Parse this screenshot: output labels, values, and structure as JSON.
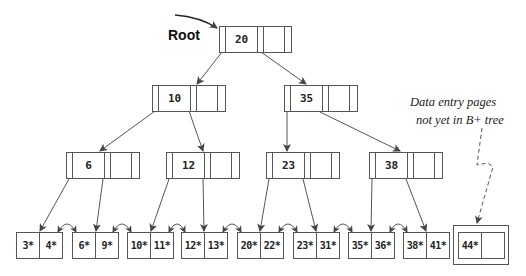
{
  "diagram": {
    "root_label": "Root",
    "note_lines": [
      "Data entry pages",
      "not yet in B+ tree"
    ],
    "line_color": "#555555",
    "levels": {
      "root": [
        {
          "id": "n20",
          "key": "20"
        }
      ],
      "level1": [
        {
          "id": "n10",
          "key": "10"
        },
        {
          "id": "n35",
          "key": "35"
        }
      ],
      "level2": [
        {
          "id": "n6",
          "key": "6"
        },
        {
          "id": "n12",
          "key": "12"
        },
        {
          "id": "n23",
          "key": "23"
        },
        {
          "id": "n38",
          "key": "38"
        }
      ]
    },
    "leaves": [
      {
        "entries": [
          "3*",
          "4*"
        ]
      },
      {
        "entries": [
          "6*",
          "9*"
        ]
      },
      {
        "entries": [
          "10*",
          "11*"
        ]
      },
      {
        "entries": [
          "12*",
          "13*"
        ]
      },
      {
        "entries": [
          "20*",
          "22*"
        ]
      },
      {
        "entries": [
          "23*",
          "31*"
        ]
      },
      {
        "entries": [
          "35*",
          "36*"
        ]
      },
      {
        "entries": [
          "38*",
          "41*"
        ]
      }
    ],
    "pending_leaf": {
      "entries": [
        "44*",
        ""
      ]
    },
    "edges": [
      [
        "n20",
        "n10"
      ],
      [
        "n20",
        "n35"
      ],
      [
        "n10",
        "n6"
      ],
      [
        "n10",
        "n12"
      ],
      [
        "n35",
        "n23"
      ],
      [
        "n35",
        "n38"
      ],
      [
        "n6",
        "leaf0"
      ],
      [
        "n6",
        "leaf1"
      ],
      [
        "n12",
        "leaf2"
      ],
      [
        "n12",
        "leaf3"
      ],
      [
        "n23",
        "leaf4"
      ],
      [
        "n23",
        "leaf5"
      ],
      [
        "n38",
        "leaf6"
      ],
      [
        "n38",
        "leaf7"
      ]
    ]
  }
}
